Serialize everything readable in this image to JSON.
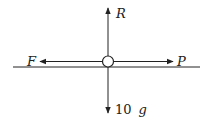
{
  "diagram": {
    "type": "free-body-diagram",
    "body": {
      "shape": "circle",
      "cx": 108,
      "cy": 61.5,
      "r": 5.5
    },
    "surface": {
      "x1": 13,
      "x2": 200,
      "y": 67
    },
    "forces": [
      {
        "id": "R",
        "label": "R",
        "direction": "up",
        "x1": 108,
        "y1": 56,
        "x2": 108,
        "y2": 8,
        "label_x": 116,
        "label_y": 18
      },
      {
        "id": "F",
        "label": "F",
        "direction": "left",
        "x1": 102,
        "y1": 61.5,
        "x2": 40,
        "y2": 61.5,
        "label_x": 27,
        "label_y": 66
      },
      {
        "id": "P",
        "label": "P",
        "direction": "right",
        "x1": 114,
        "y1": 61.5,
        "x2": 173,
        "y2": 61.5,
        "label_x": 177,
        "label_y": 66
      },
      {
        "id": "W",
        "label_num": "10",
        "label_var": "g",
        "direction": "down",
        "x1": 108,
        "y1": 67,
        "x2": 108,
        "y2": 113,
        "label_x": 115,
        "label_y": 114
      }
    ],
    "colors": {
      "stroke": "#222222",
      "background": "#ffffff"
    }
  }
}
